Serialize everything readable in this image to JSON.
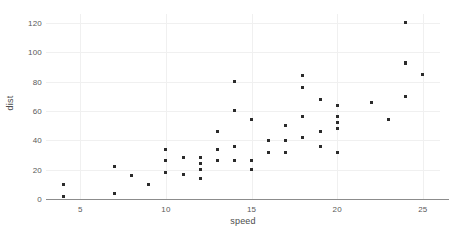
{
  "chart_data": {
    "type": "scatter",
    "title": "",
    "xlabel": "speed",
    "ylabel": "dist",
    "xlim": [
      3,
      26
    ],
    "ylim": [
      0,
      126
    ],
    "grid": true,
    "legend": null,
    "point_color": "#2b2b2b",
    "axis_color": "#8c8c8c",
    "grid_color": "#f0f0f0",
    "xticks": [
      5,
      10,
      15,
      20,
      25
    ],
    "yticks": [
      0,
      20,
      40,
      60,
      80,
      100,
      120
    ],
    "xtick_labels": [
      "5",
      "10",
      "15",
      "20",
      "25"
    ],
    "ytick_labels": [
      "0",
      "20",
      "40",
      "60",
      "80",
      "100",
      "120"
    ],
    "x": [
      4,
      4,
      7,
      7,
      8,
      9,
      10,
      10,
      10,
      11,
      11,
      12,
      12,
      12,
      12,
      13,
      13,
      13,
      13,
      14,
      14,
      14,
      14,
      15,
      15,
      15,
      16,
      16,
      17,
      17,
      17,
      18,
      18,
      18,
      18,
      19,
      19,
      19,
      20,
      20,
      20,
      20,
      20,
      22,
      23,
      24,
      24,
      24,
      24,
      25
    ],
    "y": [
      2,
      10,
      4,
      22,
      16,
      10,
      18,
      26,
      34,
      17,
      28,
      14,
      20,
      24,
      28,
      26,
      34,
      34,
      46,
      26,
      36,
      60,
      80,
      20,
      26,
      54,
      32,
      40,
      32,
      40,
      50,
      42,
      56,
      76,
      84,
      36,
      46,
      68,
      32,
      48,
      52,
      56,
      64,
      66,
      54,
      70,
      92,
      93,
      120,
      85
    ],
    "series": [
      {
        "name": "cars",
        "points": [
          [
            4,
            2
          ],
          [
            4,
            10
          ],
          [
            7,
            4
          ],
          [
            7,
            22
          ],
          [
            8,
            16
          ],
          [
            9,
            10
          ],
          [
            10,
            18
          ],
          [
            10,
            26
          ],
          [
            10,
            34
          ],
          [
            11,
            17
          ],
          [
            11,
            28
          ],
          [
            12,
            14
          ],
          [
            12,
            20
          ],
          [
            12,
            24
          ],
          [
            12,
            28
          ],
          [
            13,
            26
          ],
          [
            13,
            34
          ],
          [
            13,
            34
          ],
          [
            13,
            46
          ],
          [
            14,
            26
          ],
          [
            14,
            36
          ],
          [
            14,
            60
          ],
          [
            14,
            80
          ],
          [
            15,
            20
          ],
          [
            15,
            26
          ],
          [
            15,
            54
          ],
          [
            16,
            32
          ],
          [
            16,
            40
          ],
          [
            17,
            32
          ],
          [
            17,
            40
          ],
          [
            17,
            50
          ],
          [
            18,
            42
          ],
          [
            18,
            56
          ],
          [
            18,
            76
          ],
          [
            18,
            84
          ],
          [
            19,
            36
          ],
          [
            19,
            46
          ],
          [
            19,
            68
          ],
          [
            20,
            32
          ],
          [
            20,
            48
          ],
          [
            20,
            52
          ],
          [
            20,
            56
          ],
          [
            20,
            64
          ],
          [
            22,
            66
          ],
          [
            23,
            54
          ],
          [
            24,
            70
          ],
          [
            24,
            92
          ],
          [
            24,
            93
          ],
          [
            24,
            120
          ],
          [
            25,
            85
          ]
        ]
      }
    ]
  }
}
